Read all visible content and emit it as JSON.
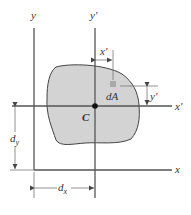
{
  "figure": {
    "labels": {
      "y_axis": "y",
      "y_prime_axis": "y′",
      "x_axis": "x",
      "x_prime_axis": "x′",
      "centroid": "C",
      "element": "dA",
      "x_prime_dim": "x′",
      "y_prime_dim": "y′",
      "d_y": "d",
      "d_y_sub": "y",
      "d_x": "d",
      "d_x_sub": "x"
    },
    "colors": {
      "area_fill": "#d3d3d3",
      "element_fill": "#a9a9a9",
      "line": "#555555"
    }
  }
}
